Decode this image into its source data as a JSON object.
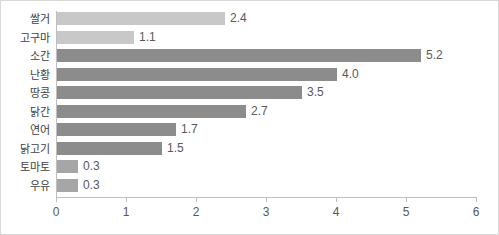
{
  "chart_data": {
    "type": "bar",
    "orientation": "horizontal",
    "title": "",
    "xlabel": "",
    "ylabel": "",
    "xlim": [
      0,
      6
    ],
    "xticks": [
      "0",
      "1",
      "2",
      "3",
      "4",
      "5",
      "6"
    ],
    "grid": false,
    "legend": "none",
    "categories": [
      "쌀거",
      "고구마",
      "소간",
      "난황",
      "땅콩",
      "닭간",
      "연어",
      "닭고기",
      "토마토",
      "우유"
    ],
    "values": [
      2.4,
      1.1,
      5.2,
      4.0,
      3.5,
      2.7,
      1.7,
      1.5,
      0.3,
      0.3
    ],
    "value_labels": [
      "2.4",
      "1.1",
      "5.2",
      "4.0",
      "3.5",
      "2.7",
      "1.7",
      "1.5",
      "0.3",
      "0.3"
    ],
    "bar_colors": [
      "#c8c8c8",
      "#c8c8c8",
      "#8c8c8c",
      "#8c8c8c",
      "#8c8c8c",
      "#8c8c8c",
      "#8c8c8c",
      "#8c8c8c",
      "#a6a6a6",
      "#a6a6a6"
    ],
    "colors": {
      "light_bar": "#c8c8c8",
      "dark_bar": "#8c8c8c",
      "medium_bar": "#a6a6a6",
      "axis": "#bfbfbf",
      "frame": "#d9d9d9",
      "label_text": "#404040",
      "value_text": "#595959",
      "background": "#ffffff"
    }
  }
}
